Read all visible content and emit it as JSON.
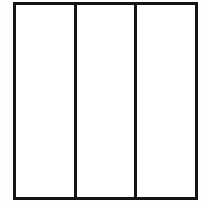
{
  "figure": {
    "shape_type": "line-diagram",
    "background_color": "#fdfdfc",
    "fill_color": "#ffffff",
    "stroke_color": "#141414",
    "stroke_width_px": 3,
    "outer_rect": {
      "x": 13,
      "y": 2,
      "width": 185,
      "height": 198
    },
    "dividers": [
      {
        "name": "divider-1",
        "x": 77,
        "orientation": "vertical"
      },
      {
        "name": "divider-2",
        "x": 139,
        "orientation": "vertical"
      }
    ],
    "panels": [
      {
        "name": "panel-left",
        "label": "",
        "fill": "#ffffff"
      },
      {
        "name": "panel-center",
        "label": "",
        "fill": "#ffffff"
      },
      {
        "name": "panel-right",
        "label": "",
        "fill": "#ffffff"
      }
    ],
    "panel_count": 3
  }
}
